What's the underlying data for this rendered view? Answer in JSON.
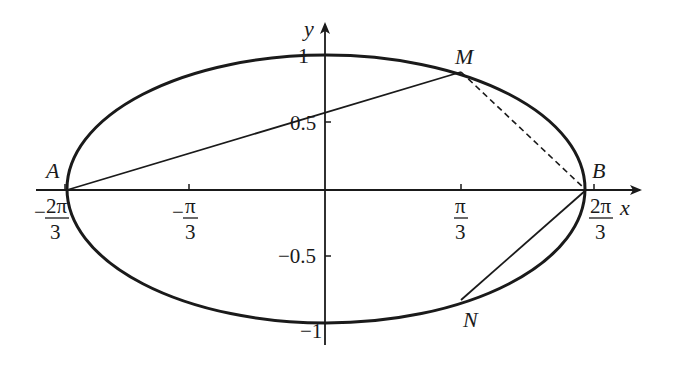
{
  "figure": {
    "type": "ellipse-with-chords",
    "axes": {
      "x_label": "x",
      "y_label": "y",
      "x_ticks": [
        {
          "id": "neg2pi3",
          "sign": "−",
          "num": "2π",
          "den": "3"
        },
        {
          "id": "negpi3",
          "sign": "−",
          "num": "π",
          "den": "3"
        },
        {
          "id": "pi3",
          "sign": "",
          "num": "π",
          "den": "3"
        },
        {
          "id": "2pi3",
          "sign": "",
          "num": "2π",
          "den": "3"
        }
      ],
      "y_ticks": [
        {
          "id": "1",
          "label": "1"
        },
        {
          "id": "0.5",
          "label": "0.5"
        },
        {
          "id": "-0.5",
          "label": "−0.5"
        },
        {
          "id": "-1",
          "label": "−1"
        }
      ]
    },
    "points": {
      "A": {
        "label": "A"
      },
      "B": {
        "label": "B"
      },
      "M": {
        "label": "M"
      },
      "N": {
        "label": "N"
      }
    },
    "segments": [
      {
        "from": "A",
        "to": "M",
        "style": "solid"
      },
      {
        "from": "M",
        "to": "B",
        "style": "dashed"
      },
      {
        "from": "B",
        "to": "N",
        "style": "solid"
      }
    ],
    "colors": {
      "stroke": "#1a1a1a",
      "background": "#ffffff"
    }
  }
}
